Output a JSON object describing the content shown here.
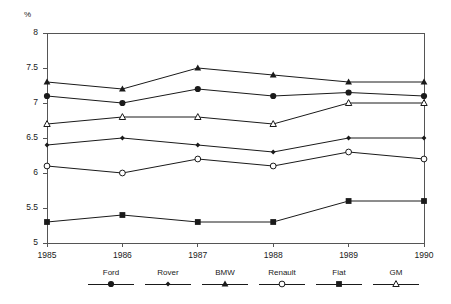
{
  "chart_data": {
    "type": "line",
    "title": "",
    "subtitle": "",
    "xlabel": "",
    "ylabel": "%",
    "unit_label": "%",
    "categories": [
      "1985",
      "1986",
      "1987",
      "1988",
      "1989",
      "1990"
    ],
    "x": [
      1985,
      1986,
      1987,
      1988,
      1989,
      1990
    ],
    "ylim": [
      5,
      8
    ],
    "ytick_labels": [
      "5",
      "5.5",
      "6",
      "6.5",
      "7",
      "7.5",
      "8"
    ],
    "ytick_values": [
      5,
      5.5,
      6,
      6.5,
      7,
      7.5,
      8
    ],
    "grid": false,
    "legend_position": "bottom",
    "series": [
      {
        "name": "Ford",
        "marker": "filled-circle",
        "color": "#1a1a1a",
        "values": [
          7.1,
          7.0,
          7.2,
          7.1,
          7.15,
          7.1
        ]
      },
      {
        "name": "Rover",
        "marker": "small-filled-diamond",
        "color": "#1a1a1a",
        "values": [
          6.4,
          6.5,
          6.4,
          6.3,
          6.5,
          6.5
        ]
      },
      {
        "name": "BMW",
        "marker": "filled-triangle",
        "color": "#1a1a1a",
        "values": [
          7.3,
          7.2,
          7.5,
          7.4,
          7.3,
          7.3
        ]
      },
      {
        "name": "Renault",
        "marker": "open-circle",
        "color": "#1a1a1a",
        "values": [
          6.1,
          6.0,
          6.2,
          6.1,
          6.3,
          6.2
        ]
      },
      {
        "name": "Fiat",
        "marker": "filled-square",
        "color": "#1a1a1a",
        "values": [
          5.3,
          5.4,
          5.3,
          5.3,
          5.6,
          5.6
        ]
      },
      {
        "name": "GM",
        "marker": "open-triangle",
        "color": "#1a1a1a",
        "values": [
          6.7,
          6.8,
          6.8,
          6.7,
          7.0,
          7.0
        ]
      }
    ]
  },
  "axis": {
    "unit": "%",
    "y_labels": [
      "8",
      "7.5",
      "7",
      "6.5",
      "6",
      "5.5",
      "5"
    ],
    "x_labels": [
      "1985",
      "1986",
      "1987",
      "1988",
      "1989",
      "1990"
    ]
  },
  "legend": {
    "items": [
      {
        "label": "Ford",
        "marker": "filled-circle"
      },
      {
        "label": "Rover",
        "marker": "small-filled-diamond"
      },
      {
        "label": "BMW",
        "marker": "filled-triangle"
      },
      {
        "label": "Renault",
        "marker": "open-circle"
      },
      {
        "label": "Fiat",
        "marker": "filled-square"
      },
      {
        "label": "GM",
        "marker": "open-triangle"
      }
    ]
  },
  "colors": {
    "ink": "#1a1a1a",
    "axis": "#555555",
    "background": "#ffffff"
  }
}
